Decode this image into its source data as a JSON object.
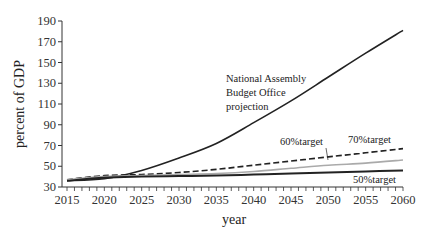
{
  "chart_data": {
    "type": "line",
    "title": "",
    "xlabel": "year",
    "ylabel": "percent of GDP",
    "xlim": [
      2015,
      2060
    ],
    "ylim": [
      30,
      190
    ],
    "x_ticks": [
      2015,
      2020,
      2025,
      2030,
      2035,
      2040,
      2045,
      2050,
      2055,
      2060
    ],
    "y_ticks": [
      30,
      50,
      70,
      90,
      110,
      130,
      150,
      170,
      190
    ],
    "grid": false,
    "x": [
      2015,
      2020,
      2025,
      2030,
      2035,
      2040,
      2045,
      2050,
      2055,
      2060
    ],
    "series": [
      {
        "name": "National Assembly Budget Office projection",
        "style": "solid-black",
        "values": [
          36,
          38,
          46,
          58,
          72,
          92,
          113,
          136,
          159,
          181
        ]
      },
      {
        "name": "70%target",
        "style": "dashed-black",
        "values": [
          37,
          41,
          42,
          44,
          47,
          51,
          55,
          59,
          63,
          67
        ]
      },
      {
        "name": "60%target",
        "style": "solid-gray",
        "values": [
          37,
          40,
          41,
          42,
          43,
          45,
          48,
          51,
          53,
          56
        ]
      },
      {
        "name": "50%target",
        "style": "solid-black-thick",
        "values": [
          36,
          39,
          40,
          40.5,
          41,
          42,
          43,
          44,
          45,
          46
        ]
      }
    ],
    "annotations": [
      {
        "text": "National Assembly",
        "x": 2024,
        "y": 150
      },
      {
        "text": "Budget Office",
        "x": 2024,
        "y": 136
      },
      {
        "text": "projection",
        "x": 2024,
        "y": 122
      },
      {
        "text": "60%target",
        "x": 2037,
        "y": 71
      },
      {
        "text": "70%target",
        "x": 2049,
        "y": 73
      },
      {
        "text": "50%target",
        "x": 2053,
        "y": 35
      }
    ]
  },
  "labels": {
    "xlabel": "year",
    "ylabel": "percent of GDP",
    "nabo_1": "National Assembly",
    "nabo_2": "Budget Office",
    "nabo_3": "projection",
    "t60": "60%target",
    "t70": "70%target",
    "t50": "50%target"
  },
  "colors": {
    "black": "#222222",
    "gray": "#aaaaaa"
  }
}
